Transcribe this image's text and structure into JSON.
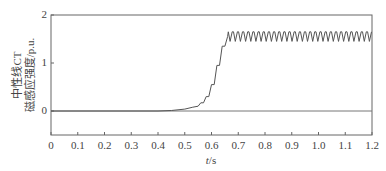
{
  "chart_data": {
    "type": "line",
    "title": "",
    "xlabel": "t/s",
    "xlabel_italic_part": "t",
    "xlabel_unit": "/s",
    "ylabel_lines": [
      "中性线CT",
      "磁感应强度/p.u."
    ],
    "xlim": [
      0,
      1.2
    ],
    "ylim": [
      -0.5,
      2
    ],
    "xticks": [
      0,
      0.1,
      0.2,
      0.3,
      0.4,
      0.5,
      0.6,
      0.7,
      0.8,
      0.9,
      1.0,
      1.1,
      1.2
    ],
    "xtick_labels": [
      "0",
      "0.1",
      "0.2",
      "0.3",
      "0.4",
      "0.5",
      "0.6",
      "0.7",
      "0.8",
      "0.9",
      "1.0",
      "1.1",
      "1.2"
    ],
    "yticks": [
      0,
      1,
      2
    ],
    "ytick_labels": [
      "0",
      "1",
      "2"
    ],
    "grid": false,
    "legend": null,
    "series": [
      {
        "name": "neutral CT flux density",
        "color": "#555555",
        "x": [
          0,
          0.4,
          0.45,
          0.5,
          0.53,
          0.55,
          0.56,
          0.57,
          0.58,
          0.59,
          0.6,
          0.61,
          0.62,
          0.63,
          0.64,
          0.65,
          0.66,
          0.67,
          1.2
        ],
        "y": [
          0,
          0.0,
          0.01,
          0.04,
          0.08,
          0.1,
          0.17,
          0.17,
          0.3,
          0.3,
          0.55,
          0.55,
          0.95,
          0.95,
          1.35,
          1.35,
          1.55,
          1.55,
          1.55
        ]
      }
    ],
    "steady_state": {
      "t_start": 0.66,
      "center": 1.55,
      "amplitude": 0.1,
      "cycles": 28
    },
    "annotations": []
  }
}
